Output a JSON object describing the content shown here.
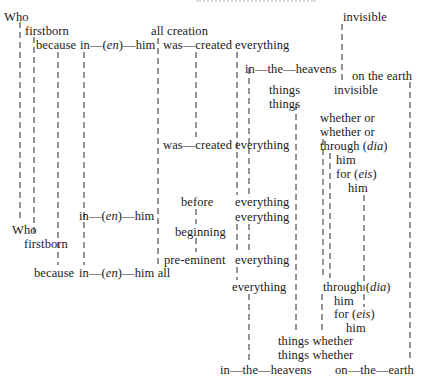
{
  "diagram": {
    "words": [
      {
        "id": "w1",
        "text": "Who",
        "x": 4,
        "y": 10
      },
      {
        "id": "w2",
        "text": "firstborn",
        "x": 25,
        "y": 24
      },
      {
        "id": "w3",
        "text": "because",
        "x": 36,
        "y": 38
      },
      {
        "id": "w4",
        "text": "in—(en)—him",
        "x": 80,
        "y": 38
      },
      {
        "id": "w5",
        "text": "all creation",
        "x": 151,
        "y": 24
      },
      {
        "id": "w6",
        "text": "was—created",
        "x": 163,
        "y": 38
      },
      {
        "id": "w7",
        "text": "everything",
        "x": 235,
        "y": 38
      },
      {
        "id": "w8",
        "text": "in—the—heavens",
        "x": 245,
        "y": 62
      },
      {
        "id": "w9",
        "text": "invisible",
        "x": 343,
        "y": 10
      },
      {
        "id": "w10",
        "text": "on the earth",
        "x": 352,
        "y": 69
      },
      {
        "id": "w11",
        "text": "things",
        "x": 269,
        "y": 83
      },
      {
        "id": "w12",
        "text": "invisible",
        "x": 334,
        "y": 83
      },
      {
        "id": "w13",
        "text": "things",
        "x": 269,
        "y": 97
      },
      {
        "id": "w14",
        "text": "whether or",
        "x": 320,
        "y": 111
      },
      {
        "id": "w15",
        "text": "whether or",
        "x": 320,
        "y": 125
      },
      {
        "id": "w16",
        "text": "was—created",
        "x": 163,
        "y": 138
      },
      {
        "id": "w17",
        "text": "everything",
        "x": 235,
        "y": 138
      },
      {
        "id": "w18",
        "text": "through (dia)",
        "x": 320,
        "y": 139
      },
      {
        "id": "w19",
        "text": "him",
        "x": 336,
        "y": 153
      },
      {
        "id": "w20",
        "text": "for (eis)",
        "x": 336,
        "y": 167
      },
      {
        "id": "w21",
        "text": "him",
        "x": 348,
        "y": 181
      },
      {
        "id": "w22",
        "text": "before",
        "x": 181,
        "y": 195
      },
      {
        "id": "w23",
        "text": "everything",
        "x": 235,
        "y": 195
      },
      {
        "id": "w24",
        "text": "in—(en)—him",
        "x": 79,
        "y": 209
      },
      {
        "id": "w25",
        "text": "everything",
        "x": 235,
        "y": 210
      },
      {
        "id": "w26",
        "text": "Who",
        "x": 12,
        "y": 223
      },
      {
        "id": "w27",
        "text": "beginning",
        "x": 175,
        "y": 225
      },
      {
        "id": "w28",
        "text": "firstborn",
        "x": 24,
        "y": 237
      },
      {
        "id": "w29",
        "text": "pre-eminent",
        "x": 164,
        "y": 253
      },
      {
        "id": "w30",
        "text": "everything",
        "x": 235,
        "y": 253
      },
      {
        "id": "w31",
        "text": "because",
        "x": 34,
        "y": 266
      },
      {
        "id": "w32",
        "text": "in—(en)—him all",
        "x": 79,
        "y": 266
      },
      {
        "id": "w33",
        "text": "everything",
        "x": 232,
        "y": 280
      },
      {
        "id": "w34",
        "text": "through (dia)",
        "x": 323,
        "y": 280
      },
      {
        "id": "w35",
        "text": "him",
        "x": 334,
        "y": 294
      },
      {
        "id": "w36",
        "text": "for (eis)",
        "x": 334,
        "y": 307
      },
      {
        "id": "w37",
        "text": "him",
        "x": 346,
        "y": 321
      },
      {
        "id": "w38",
        "text": "things whether",
        "x": 278,
        "y": 334
      },
      {
        "id": "w39",
        "text": "things whether",
        "x": 278,
        "y": 348
      },
      {
        "id": "w40",
        "text": "in—the—heavens",
        "x": 220,
        "y": 363
      },
      {
        "id": "w41",
        "text": "on—the—earth",
        "x": 335,
        "y": 363
      }
    ],
    "connectors": [
      {
        "x": 20,
        "y1": 22,
        "y2": 222
      },
      {
        "x": 34,
        "y1": 37,
        "y2": 236
      },
      {
        "x": 58,
        "y1": 52,
        "y2": 265
      },
      {
        "x": 84,
        "y1": 52,
        "y2": 265
      },
      {
        "x": 158,
        "y1": 38,
        "y2": 265
      },
      {
        "x": 196,
        "y1": 52,
        "y2": 137
      },
      {
        "x": 237,
        "y1": 52,
        "y2": 195
      },
      {
        "x": 249,
        "y1": 68,
        "y2": 195
      },
      {
        "x": 296,
        "y1": 104,
        "y2": 332
      },
      {
        "x": 342,
        "y1": 24,
        "y2": 83
      },
      {
        "x": 410,
        "y1": 82,
        "y2": 361
      },
      {
        "x": 323,
        "y1": 139,
        "y2": 278
      },
      {
        "x": 330,
        "y1": 153,
        "y2": 278
      },
      {
        "x": 364,
        "y1": 195,
        "y2": 292
      },
      {
        "x": 196,
        "y1": 209,
        "y2": 224
      },
      {
        "x": 196,
        "y1": 238,
        "y2": 252
      },
      {
        "x": 237,
        "y1": 224,
        "y2": 252
      },
      {
        "x": 249,
        "y1": 224,
        "y2": 252
      },
      {
        "x": 237,
        "y1": 267,
        "y2": 280
      },
      {
        "x": 249,
        "y1": 294,
        "y2": 362
      },
      {
        "x": 322,
        "y1": 294,
        "y2": 334
      },
      {
        "x": 364,
        "y1": 294,
        "y2": 307
      }
    ]
  }
}
